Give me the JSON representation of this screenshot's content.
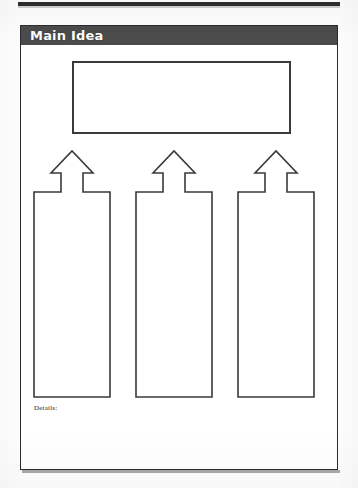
{
  "page": {
    "title": "Main Idea",
    "background_color": "#fdfdfd",
    "paper_color": "#ffffff"
  },
  "header": {
    "label": "Main Idea",
    "bar_color": "#4b4b4b",
    "text_color": "#ffffff"
  },
  "main_idea_box": {
    "value": "",
    "placeholder": "",
    "border_color": "#3a3a3a"
  },
  "arrows": [
    {
      "name": "arrow-to-detail-1",
      "direction": "up"
    },
    {
      "name": "arrow-to-detail-2",
      "direction": "up"
    },
    {
      "name": "arrow-to-detail-3",
      "direction": "up"
    }
  ],
  "detail_columns": [
    {
      "label": "",
      "value": "",
      "placeholder": ""
    },
    {
      "label": "",
      "value": "",
      "placeholder": ""
    },
    {
      "label": "",
      "value": "",
      "placeholder": ""
    }
  ],
  "details_label": "Details:",
  "colors": {
    "ink": "#2b2b2b",
    "banner": "#4b4b4b",
    "box_border": "#3a3a3a",
    "strip": "#2e2e2e"
  }
}
